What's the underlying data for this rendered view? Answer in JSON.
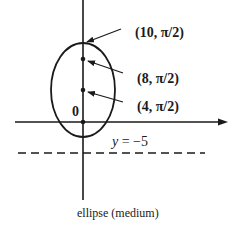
{
  "diagram": {
    "type": "polar-conic",
    "caption": "ellipse (medium)",
    "origin_label": "0",
    "directrix": {
      "label_var": "y",
      "label_rest": " = −5",
      "y_value": -5,
      "style": "dashed"
    },
    "points": [
      {
        "label": "(10, π/2)",
        "r": 10,
        "theta": "π/2",
        "marker": false
      },
      {
        "label": "(8, π/2)",
        "r": 8,
        "theta": "π/2",
        "marker": true
      },
      {
        "label": "(4, π/2)",
        "r": 4,
        "theta": "π/2",
        "marker": true
      }
    ],
    "shape": "ellipse",
    "colors": {
      "stroke": "#1a1a1a",
      "background": "#ffffff"
    }
  }
}
